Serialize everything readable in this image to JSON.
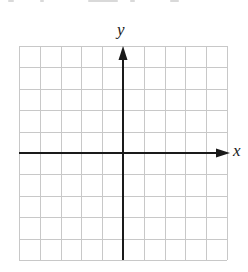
{
  "figure": {
    "type": "coordinate-plane",
    "axis_labels": {
      "x": "x",
      "y": "y"
    },
    "grid": {
      "columns": 10,
      "rows": 10,
      "left": 19,
      "top": 46,
      "right": 227,
      "bottom": 260,
      "line_color": "#c8c8c8"
    },
    "axes": {
      "origin_px": [
        123,
        153
      ],
      "color": "#1a1a1a",
      "x_arrow": "positive-only",
      "y_arrow": "positive-only",
      "x_axis_end_px": 230,
      "y_axis_end_px": 46
    },
    "top_edge_text": "(cropped, illegible)"
  }
}
